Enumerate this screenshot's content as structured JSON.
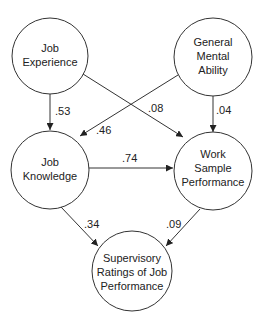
{
  "diagram": {
    "type": "path-diagram",
    "nodes": [
      {
        "id": "job_experience",
        "lines": [
          "Job",
          "Experience"
        ]
      },
      {
        "id": "general_mental_ability",
        "lines": [
          "General",
          "Mental",
          "Ability"
        ]
      },
      {
        "id": "job_knowledge",
        "lines": [
          "Job",
          "Knowledge"
        ]
      },
      {
        "id": "work_sample_performance",
        "lines": [
          "Work",
          "Sample",
          "Performance"
        ]
      },
      {
        "id": "supervisory_ratings",
        "lines": [
          "Supervisory",
          "Ratings of Job",
          "Performance"
        ]
      }
    ],
    "edges": [
      {
        "from": "job_experience",
        "to": "job_knowledge",
        "label": ".53"
      },
      {
        "from": "job_experience",
        "to": "work_sample_performance",
        "label": ".08"
      },
      {
        "from": "general_mental_ability",
        "to": "job_knowledge",
        "label": ".46"
      },
      {
        "from": "general_mental_ability",
        "to": "work_sample_performance",
        "label": ".04"
      },
      {
        "from": "job_knowledge",
        "to": "work_sample_performance",
        "label": ".74"
      },
      {
        "from": "job_knowledge",
        "to": "supervisory_ratings",
        "label": ".34"
      },
      {
        "from": "work_sample_performance",
        "to": "supervisory_ratings",
        "label": ".09"
      }
    ]
  }
}
